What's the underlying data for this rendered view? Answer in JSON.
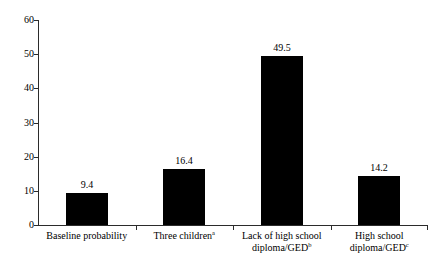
{
  "figure": {
    "title_remnant": "",
    "background_color": "#ffffff",
    "bar_color": "#000000",
    "axis_color": "#2b2b2b"
  },
  "chart_data": {
    "type": "bar",
    "title": "",
    "xlabel": "",
    "ylabel": "",
    "ylim": [
      0,
      60
    ],
    "yticks": [
      0,
      10,
      20,
      30,
      40,
      50,
      60
    ],
    "ytick_labels": [
      "0",
      "10",
      "20",
      "30",
      "40",
      "50",
      "60"
    ],
    "grid": false,
    "legend": false,
    "categories": [
      "Baseline probability",
      "Three children",
      "Lack of high school diploma/GED",
      "High school diploma/GED"
    ],
    "category_footnotes": [
      "",
      "a",
      "b",
      "c"
    ],
    "category_lines": [
      [
        "Baseline probability"
      ],
      [
        "Three children"
      ],
      [
        "Lack of high school",
        "diploma/GED"
      ],
      [
        "High school",
        "diploma/GED"
      ]
    ],
    "values": [
      9.4,
      16.4,
      49.5,
      14.2
    ],
    "value_labels": [
      "9.4",
      "16.4",
      "49.5",
      "14.2"
    ]
  }
}
